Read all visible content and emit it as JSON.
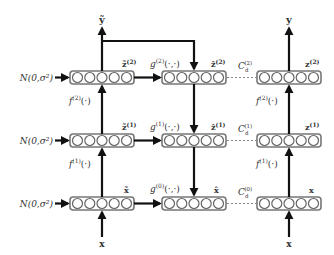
{
  "diagram": {
    "noise_label": "N(0,σ²)",
    "top_outputs": {
      "corrupted": "ỹ",
      "clean": "y"
    },
    "bottom_inputs": {
      "corrupted": "x",
      "clean": "x"
    },
    "columns": [
      "corrupted-encoder",
      "decoder",
      "clean-encoder"
    ],
    "rows": [
      {
        "level": 2,
        "corrupted_label": "z̃",
        "corrupted_sup": "(2)",
        "decoder_fn": "g",
        "decoder_sup": "(2)",
        "decoder_args": "(·,·)",
        "decoder_label": "ẑ",
        "decoder_label_sup": "(2)",
        "cost_label": "C",
        "cost_sub": "d",
        "cost_sup": "(2)",
        "clean_label": "z",
        "clean_sup": "(2)",
        "encoder_fn": "f",
        "encoder_sup": "(2)",
        "encoder_args": "(·)"
      },
      {
        "level": 1,
        "corrupted_label": "z̃",
        "corrupted_sup": "(1)",
        "decoder_fn": "g",
        "decoder_sup": "(1)",
        "decoder_args": "(·,·)",
        "decoder_label": "ẑ",
        "decoder_label_sup": "(1)",
        "cost_label": "C",
        "cost_sub": "d",
        "cost_sup": "(1)",
        "clean_label": "z",
        "clean_sup": "(1)",
        "encoder_fn": "f",
        "encoder_sup": "(1)",
        "encoder_args": "(·)"
      },
      {
        "level": 0,
        "corrupted_label": "x̃",
        "corrupted_sup": "",
        "decoder_fn": "g",
        "decoder_sup": "(0)",
        "decoder_args": "(·,·)",
        "decoder_label": "x̂",
        "decoder_label_sup": "",
        "cost_label": "C",
        "cost_sub": "d",
        "cost_sup": "(0)",
        "clean_label": "x",
        "clean_sup": ""
      }
    ],
    "units_per_layer": 5,
    "colors": {
      "arrow": "#111111",
      "box_border": "#777777",
      "unit_border": "#666666",
      "dotted_link": "#888888",
      "text": "#333333"
    }
  }
}
